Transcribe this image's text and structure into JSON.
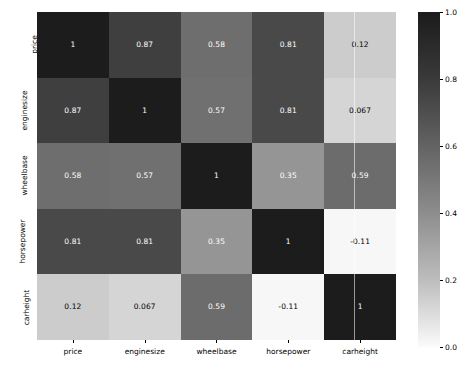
{
  "chart_data": {
    "type": "heatmap",
    "title": "",
    "xlabel": "",
    "ylabel": "",
    "categories": [
      "price",
      "enginesize",
      "wheelbase",
      "horsepower",
      "carheight"
    ],
    "x_tick_labels": [
      "price",
      "enginesize",
      "wheelbase",
      "horsepower",
      "carheight"
    ],
    "y_tick_labels": [
      "price",
      "enginesize",
      "wheelbase",
      "horsepower",
      "carheight"
    ],
    "matrix": [
      [
        1,
        0.87,
        0.58,
        0.81,
        0.12
      ],
      [
        0.87,
        1,
        0.57,
        0.81,
        0.067
      ],
      [
        0.58,
        0.57,
        1,
        0.35,
        0.59
      ],
      [
        0.81,
        0.81,
        0.35,
        1,
        -0.11
      ],
      [
        0.12,
        0.067,
        0.59,
        -0.11,
        1
      ]
    ],
    "cell_labels": [
      [
        "1",
        "0.87",
        "0.58",
        "0.81",
        "0.12"
      ],
      [
        "0.87",
        "1",
        "0.57",
        "0.81",
        "0.067"
      ],
      [
        "0.58",
        "0.57",
        "1",
        "0.35",
        "0.59"
      ],
      [
        "0.81",
        "0.81",
        "0.35",
        "1",
        "-0.11"
      ],
      [
        "0.12",
        "0.067",
        "0.59",
        "-0.11",
        "1"
      ]
    ],
    "cell_colors": [
      [
        "#1c1c1c",
        "#3f3f3f",
        "#6e6e6e",
        "#494949",
        "#cccccc"
      ],
      [
        "#3f3f3f",
        "#1c1c1c",
        "#707070",
        "#494949",
        "#d5d5d5"
      ],
      [
        "#6e6e6e",
        "#707070",
        "#1c1c1c",
        "#959595",
        "#6c6c6c"
      ],
      [
        "#494949",
        "#494949",
        "#959595",
        "#1c1c1c",
        "#f7f7f7"
      ],
      [
        "#cccccc",
        "#d5d5d5",
        "#6c6c6c",
        "#f7f7f7",
        "#1c1c1c"
      ]
    ],
    "cell_text_colors": [
      [
        "#ffffff",
        "#ffffff",
        "#ffffff",
        "#ffffff",
        "#000000"
      ],
      [
        "#ffffff",
        "#ffffff",
        "#ffffff",
        "#ffffff",
        "#000000"
      ],
      [
        "#ffffff",
        "#ffffff",
        "#ffffff",
        "#ffffff",
        "#ffffff"
      ],
      [
        "#ffffff",
        "#ffffff",
        "#ffffff",
        "#ffffff",
        "#000000"
      ],
      [
        "#000000",
        "#000000",
        "#ffffff",
        "#000000",
        "#ffffff"
      ]
    ],
    "colormap": "gray_reversed",
    "grid": false,
    "legend": "colorbar-right",
    "colorbar": {
      "ticks": [
        1.0,
        0.8,
        0.6,
        0.4,
        0.2,
        0.0
      ],
      "tick_labels": [
        "1.0",
        "0.8",
        "0.6",
        "0.4",
        "0.2",
        "0.0"
      ],
      "vmin": 0.0,
      "vmax": 1.0,
      "top_color": "#1b1b1b",
      "bottom_color": "#fbfbfb"
    }
  }
}
